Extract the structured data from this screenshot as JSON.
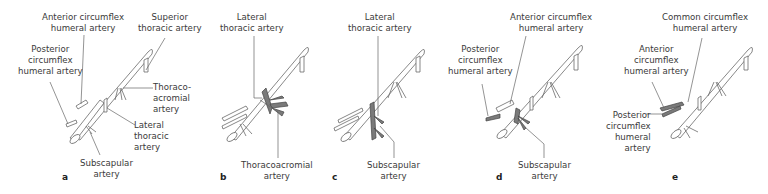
{
  "figure": {
    "panels": [
      {
        "letter": "a",
        "labels": {
          "anterior_circumflex": [
            "Anterior circumflex",
            "humeral artery"
          ],
          "superior_thoracic": [
            "Superior",
            "thoracic artery"
          ],
          "posterior_circumflex": [
            "Posterior",
            "circumflex",
            "humeral artery"
          ],
          "thoracoacromial": [
            "Thoraco-",
            "acromial",
            "artery"
          ],
          "lateral_thoracic": [
            "Lateral",
            "thoracic",
            "artery"
          ],
          "subscapular": [
            "Subscapular",
            "artery"
          ]
        }
      },
      {
        "letter": "b",
        "highlighted": "Thoracoacromial artery",
        "labels": {
          "lateral_thoracic": [
            "Lateral",
            "thoracic artery"
          ],
          "thoracoacromial": [
            "Thoracoacromial",
            "artery"
          ]
        }
      },
      {
        "letter": "c",
        "highlighted": "Subscapular artery",
        "labels": {
          "lateral_thoracic": [
            "Lateral",
            "thoracic artery"
          ],
          "subscapular": [
            "Subscapular",
            "artery"
          ]
        }
      },
      {
        "letter": "d",
        "highlighted": "Subscapular artery",
        "labels": {
          "anterior_circumflex": [
            "Anterior circumflex",
            "humeral artery"
          ],
          "posterior_circumflex": [
            "Posterior",
            "circumflex",
            "humeral artery"
          ],
          "subscapular": [
            "Subscapular",
            "artery"
          ]
        }
      },
      {
        "letter": "e",
        "highlighted": "Common circumflex humeral artery",
        "labels": {
          "common_circumflex": [
            "Common circumflex",
            "humeral artery"
          ],
          "anterior_circumflex": [
            "Anterior",
            "circumflex",
            "humeral artery"
          ],
          "posterior_circumflex": [
            "Posterior",
            "circumflex",
            "humeral",
            "artery"
          ]
        }
      }
    ],
    "colors": {
      "vessel_fill": "#ffffff",
      "vessel_outline": "#6a6a6a",
      "highlight": "#7a7a7a",
      "text": "#3a3a3a"
    }
  }
}
